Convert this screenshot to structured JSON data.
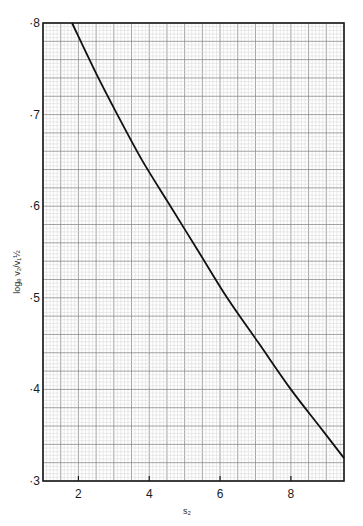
{
  "chart_data": {
    "type": "line",
    "title": "",
    "xlabel": "s₂",
    "ylabel": "logₑ v₂/v₁½",
    "xlim": [
      1.0,
      9.5
    ],
    "ylim": [
      0.3,
      0.8
    ],
    "x_ticks": [
      2,
      4,
      6,
      8
    ],
    "x_tick_labels": [
      "2",
      "4",
      "6",
      "8"
    ],
    "y_ticks": [
      0.3,
      0.4,
      0.5,
      0.6,
      0.7,
      0.8
    ],
    "y_tick_labels": [
      "·3",
      "·4",
      "·5",
      "·6",
      "·7",
      "·8"
    ],
    "grid": true,
    "grid_style": "graph paper (major + minor lines)",
    "legend": null,
    "series": [
      {
        "name": "curve",
        "x": [
          1.82,
          2.5,
          3.1,
          3.8,
          4.6,
          5.4,
          6.2,
          7.1,
          8.0,
          8.8,
          9.5
        ],
        "y": [
          0.8,
          0.745,
          0.7,
          0.65,
          0.6,
          0.55,
          0.5,
          0.45,
          0.4,
          0.36,
          0.325
        ]
      }
    ]
  },
  "colors": {
    "background": "#ffffff",
    "grid_minor": "#d4d4d4",
    "grid_major": "#8a8a8a",
    "frame": "#1a1a1a",
    "curve": "#111111"
  }
}
